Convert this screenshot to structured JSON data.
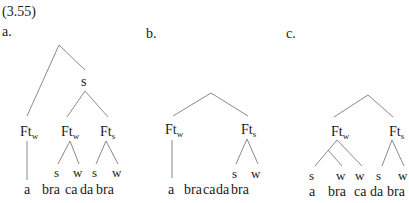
{
  "example_number": "(3.55)",
  "trees": [
    {
      "label": "a.",
      "nodes": {
        "upper_s": "s",
        "feet": [
          {
            "base": "Ft",
            "sub": "w"
          },
          {
            "base": "Ft",
            "sub": "w"
          },
          {
            "base": "Ft",
            "sub": "s"
          }
        ]
      },
      "prominence": [
        "s",
        "w",
        "s",
        "w"
      ],
      "syllables": [
        "a",
        "bra",
        "ca",
        "da",
        "bra"
      ]
    },
    {
      "label": "b.",
      "nodes": {
        "feet": [
          {
            "base": "Ft",
            "sub": "w"
          },
          {
            "base": "Ft",
            "sub": "s"
          }
        ]
      },
      "prominence": [
        "s",
        "w"
      ],
      "syllables": [
        "a",
        "bra",
        "ca",
        "da",
        "bra"
      ]
    },
    {
      "label": "c.",
      "nodes": {
        "feet": [
          {
            "base": "Ft",
            "sub": "w"
          },
          {
            "base": "Ft",
            "sub": "s"
          }
        ]
      },
      "prominence": [
        "s",
        "w",
        "w",
        "s",
        "w"
      ],
      "syllables": [
        "a",
        "bra",
        "ca",
        "da",
        "bra"
      ]
    }
  ]
}
